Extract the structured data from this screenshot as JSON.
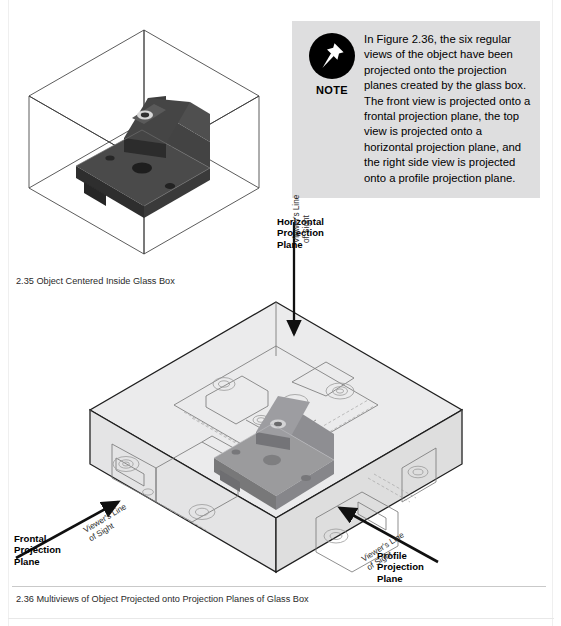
{
  "note": {
    "icon": "push-pin-icon",
    "label": "NOTE",
    "body": "In Figure 2.36, the six regular views of the object have been projected onto the projection planes created by the glass box. The front view is projected onto a frontal projection plane, the top view is projected onto a horizontal projection plane, and the right side view is projected onto a profile projection plane.",
    "background_color": "#dededf"
  },
  "figures": [
    {
      "number": "2.35",
      "caption": "2.35 Object Centered Inside Glass Box",
      "kind": "isometric-wireframe-cube-with-solid-object"
    },
    {
      "number": "2.36",
      "caption": "2.36 Multiviews of Object Projected onto Projection Planes of Glass Box",
      "kind": "isometric-glass-box-with-projected-views"
    }
  ],
  "labels": {
    "horizontal_plane": "Horizontal\nProjection\nPlane",
    "frontal_plane": "Frontal\nProjection\nPlane",
    "profile_plane": "Profile\nProjection\nPlane",
    "line_of_sight_top": "Viewer's Line\nof Sight",
    "line_of_sight_left": "Viewer's Line\nof Sight",
    "line_of_sight_right": "Viewer's Line\nof Sight"
  },
  "colors": {
    "note_bg": "#dededf",
    "glass_box_fill": "#e9e9ea",
    "object_dark": "#3a3a3a",
    "object_gray": "#8e8e90",
    "line": "#1a1a1a"
  }
}
